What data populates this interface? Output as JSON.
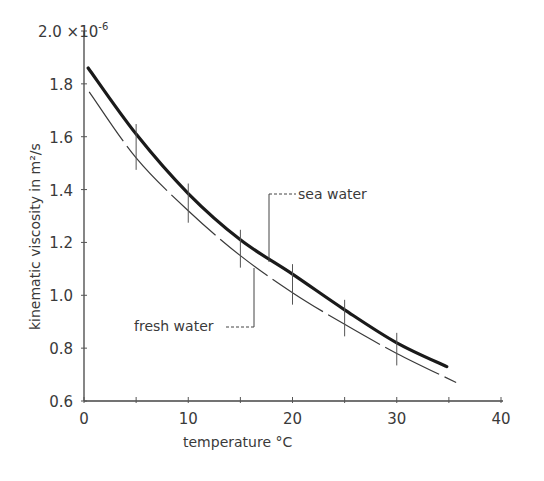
{
  "chart_data": {
    "type": "line",
    "title": "",
    "xlabel": "temperature  °C",
    "ylabel": "kinematic viscosity in  m²/s",
    "y_multiplier": "×10⁻⁶",
    "y_multiplier_parts": {
      "base": "2.0 ×",
      "ten": "10",
      "exp": "-6"
    },
    "xlim": [
      0,
      40
    ],
    "ylim": [
      0.6,
      2.0
    ],
    "xticks": [
      0,
      10,
      20,
      30,
      40
    ],
    "xticks_minor": [
      5,
      15,
      25,
      35
    ],
    "xtick_labels": [
      "0",
      "10",
      "20",
      "30",
      "40"
    ],
    "yticks": [
      0.6,
      0.8,
      1.0,
      1.2,
      1.4,
      1.6,
      1.8,
      2.0
    ],
    "ytick_labels": [
      "0.6",
      "0.8",
      "1.0",
      "1.2",
      "1.4",
      "1.6",
      "1.8"
    ],
    "grid": false,
    "legend": "inline annotations with leader lines",
    "series": [
      {
        "name": "sea water",
        "style": "thick solid",
        "x": [
          0.4,
          5,
          10,
          15,
          20,
          25,
          30,
          34.8
        ],
        "values": [
          1.86,
          1.61,
          1.385,
          1.21,
          1.08,
          0.945,
          0.82,
          0.73
        ]
      },
      {
        "name": "fresh water",
        "style": "thin long-dash",
        "x": [
          0.5,
          5,
          10,
          15,
          20,
          25,
          30,
          35.7
        ],
        "values": [
          1.77,
          1.52,
          1.32,
          1.15,
          1.01,
          0.89,
          0.78,
          0.67
        ]
      }
    ],
    "annotations": [
      {
        "text": "sea water",
        "points_to_series": "sea water"
      },
      {
        "text": "fresh water",
        "points_to_series": "fresh water"
      }
    ]
  }
}
